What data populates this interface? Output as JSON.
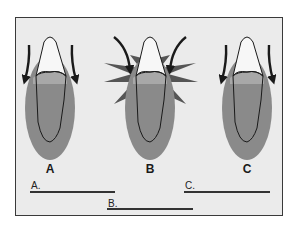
{
  "figure": {
    "panels": [
      {
        "id": "A",
        "label": "A",
        "arrows": "downward-outward",
        "burst": false
      },
      {
        "id": "B",
        "label": "B",
        "arrows": "inward-downward",
        "burst": true
      },
      {
        "id": "C",
        "label": "C",
        "arrows": "downward-outward",
        "burst": false
      }
    ],
    "answer_blanks": [
      {
        "label": "A."
      },
      {
        "label": "B."
      },
      {
        "label": "C."
      }
    ],
    "colors": {
      "background": "#ebebeb",
      "border": "#3a3a3a",
      "gum": "#8a8a8a",
      "gum_light": "#a8a8a8",
      "burst": "#555555",
      "crown": "#f7f7f7",
      "outline": "#1a1a1a"
    }
  }
}
